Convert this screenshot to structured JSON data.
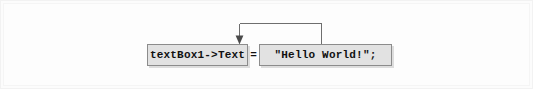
{
  "figure": {
    "background_color": "#fdfdfd",
    "width": 533,
    "height": 89
  },
  "statement": {
    "lhs": "textBox1->Text",
    "operator": "=",
    "rhs": "\"Hello World!\";",
    "full_text": "textBox1->Text = \"Hello World!\";"
  },
  "boxes": [
    {
      "id": "lhs-box",
      "label": "textBox1->Text",
      "role": "assignment-target",
      "fill_color": "#e2e2e2",
      "border_color": "#8c8c8c"
    },
    {
      "id": "rhs-box",
      "label": "\"Hello World!\";",
      "role": "assigned-value",
      "fill_color": "#e2e2e2",
      "border_color": "#8c8c8c"
    }
  ],
  "arrow": {
    "direction": "right-to-left",
    "meaning": "value flows into property",
    "color": "#6e6e6e",
    "head": "filled-triangle-down"
  }
}
